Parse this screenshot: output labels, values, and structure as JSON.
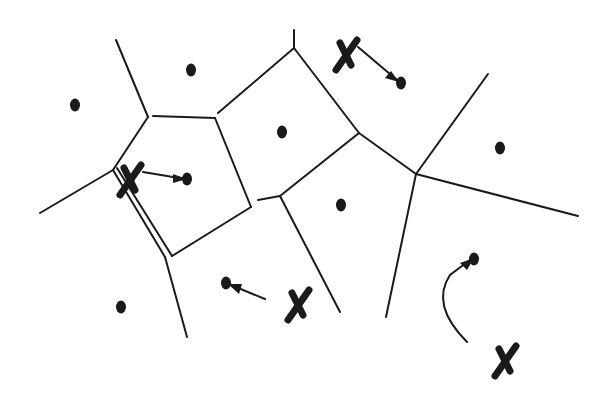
{
  "diagram": {
    "type": "voronoi",
    "width": 602,
    "height": 397,
    "colors": {
      "ink": "#1a1a1a",
      "background": "#ffffff"
    },
    "sites": [
      {
        "x": 75,
        "y": 105
      },
      {
        "x": 191,
        "y": 70
      },
      {
        "x": 282,
        "y": 132
      },
      {
        "x": 187,
        "y": 179
      },
      {
        "x": 401,
        "y": 83
      },
      {
        "x": 500,
        "y": 148
      },
      {
        "x": 341,
        "y": 205
      },
      {
        "x": 121,
        "y": 307
      },
      {
        "x": 226,
        "y": 283
      },
      {
        "x": 474,
        "y": 259
      }
    ],
    "edges": [
      [
        116,
        40,
        148,
        117
      ],
      [
        148,
        117,
        113,
        170
      ],
      [
        113,
        170,
        40,
        213
      ],
      [
        153,
        116,
        215,
        118
      ],
      [
        215,
        118,
        251,
        207
      ],
      [
        251,
        207,
        172,
        256
      ],
      [
        113,
        170,
        165,
        257
      ],
      [
        165,
        257,
        187,
        337
      ],
      [
        117,
        168,
        172,
        256
      ],
      [
        218,
        113,
        294,
        48
      ],
      [
        294,
        48,
        294,
        30
      ],
      [
        294,
        48,
        359,
        133
      ],
      [
        359,
        133,
        416,
        174
      ],
      [
        416,
        174,
        488,
        74
      ],
      [
        416,
        174,
        578,
        216
      ],
      [
        416,
        174,
        386,
        317
      ],
      [
        359,
        133,
        280,
        196
      ],
      [
        258,
        200,
        280,
        196
      ],
      [
        280,
        196,
        340,
        312
      ]
    ],
    "x_marks": [
      {
        "x": 130,
        "y": 180
      },
      {
        "x": 346,
        "y": 55
      },
      {
        "x": 298,
        "y": 305
      },
      {
        "x": 505,
        "y": 361
      }
    ],
    "arrows": [
      {
        "path": "M 143 172 L 185 179",
        "head": [
          187,
          179,
          173,
          183,
          173,
          174
        ]
      },
      {
        "path": "M 358 47 L 397 80",
        "head": [
          399,
          82,
          385,
          78,
          391,
          71
        ]
      },
      {
        "path": "M 265 299 L 231 285",
        "head": [
          228,
          284,
          242,
          284,
          239,
          294
        ]
      },
      {
        "path": "M 467 342 Q 430 305 450 275 L 470 260",
        "head": [
          474,
          258,
          467,
          270,
          460,
          263
        ]
      }
    ]
  }
}
